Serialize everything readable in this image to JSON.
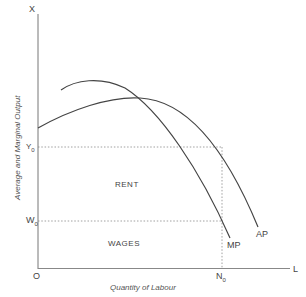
{
  "diagram": {
    "y_axis_label": "Average and Marginal Output",
    "x_axis_label": "Quantity of Labour",
    "y_axis_end": "X",
    "x_axis_end": "L",
    "origin": "O",
    "y_marks": {
      "upper": "Y",
      "upper_sub": "0",
      "lower": "W",
      "lower_sub": "0"
    },
    "x_marks": {
      "n": "N",
      "n_sub": "0"
    },
    "curves": {
      "ap": "AP",
      "mp": "MP"
    },
    "regions": {
      "rent": "RENT",
      "wages": "WAGES"
    },
    "colors": {
      "line": "#444444",
      "dotted": "#888888",
      "axis": "#666666"
    }
  }
}
